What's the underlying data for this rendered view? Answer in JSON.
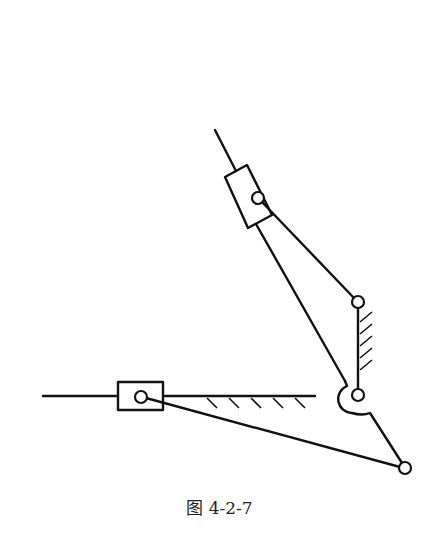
{
  "figure": {
    "caption": "图 4-2-7"
  },
  "elements": {
    "upper_guide_rod": {
      "x1": 215,
      "y1": 130,
      "x2": 236,
      "y2": 171
    },
    "upper_slider": {
      "corners": [
        [
          225,
          177
        ],
        [
          247,
          165
        ],
        [
          272,
          215
        ],
        [
          248,
          228
        ]
      ]
    },
    "upper_slider_pin": {
      "cx": 258,
      "cy": 198,
      "r": 6
    },
    "link_to_rocker": {
      "x1": 258,
      "y1": 198,
      "x2": 358,
      "y2": 302
    },
    "rod_to_crank": {
      "x1": 255,
      "y1": 224,
      "x2": 345,
      "y2": 381
    },
    "rocker_top_pin": {
      "cx": 358,
      "cy": 302,
      "r": 6
    },
    "rocker_bottom_pin": {
      "cx": 358,
      "cy": 395,
      "r": 6
    },
    "crank_end_pin": {
      "cx": 405,
      "cy": 468,
      "r": 6
    },
    "horizontal_guide": {
      "x1": 43,
      "y1": 396,
      "x2": 315,
      "y2": 396
    },
    "lower_slider": {
      "x": 118,
      "y": 382,
      "w": 45,
      "h": 28
    },
    "lower_slider_pin": {
      "cx": 141,
      "cy": 397,
      "r": 6
    },
    "lower_link": {
      "x1": 141,
      "y1": 397,
      "x2": 405,
      "y2": 468
    }
  }
}
